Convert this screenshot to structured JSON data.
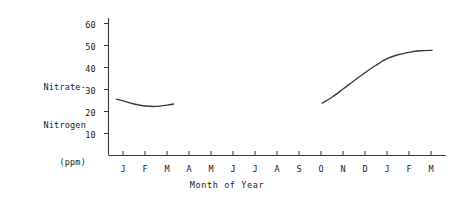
{
  "chart_data": {
    "type": "line",
    "title": "",
    "xlabel": "Month of Year",
    "ylabel": "Nitrate-Nitrogen (ppm)",
    "ylabel_lines": [
      "Nitrate-",
      "Nitrogen",
      "(ppm)"
    ],
    "categories": [
      "J",
      "F",
      "M",
      "A",
      "M",
      "J",
      "J",
      "A",
      "S",
      "O",
      "N",
      "D",
      "J",
      "F",
      "M"
    ],
    "xtick_labels": [
      "J",
      "F",
      "M",
      "A",
      "M",
      "J",
      "J",
      "A",
      "S",
      "O",
      "N",
      "D",
      "J",
      "F",
      "M"
    ],
    "ytick_labels": [
      "10",
      "20",
      "30",
      "40",
      "50",
      "60"
    ],
    "ytick_values": [
      10,
      20,
      30,
      40,
      50,
      60
    ],
    "ylim": [
      0,
      65
    ],
    "xlim": [
      0.5,
      15.5
    ],
    "grid": false,
    "legend": false,
    "line_color": "#3a3a3a",
    "axis_color": "#3a3a3a",
    "series": [
      {
        "name": "early-season",
        "x": [
          0.7,
          1.0,
          1.5,
          2.0,
          2.5,
          3.0,
          3.3
        ],
        "values": [
          25.6,
          24.8,
          23.4,
          22.5,
          22.3,
          22.9,
          23.4
        ]
      },
      {
        "name": "late-season",
        "x": [
          10.05,
          10.5,
          11.0,
          11.5,
          12.0,
          12.5,
          13.0,
          13.5,
          14.0,
          14.5,
          15.05
        ],
        "values": [
          23.8,
          26.5,
          30.2,
          34.0,
          37.6,
          41.0,
          44.0,
          45.8,
          46.9,
          47.6,
          47.8
        ]
      }
    ]
  }
}
